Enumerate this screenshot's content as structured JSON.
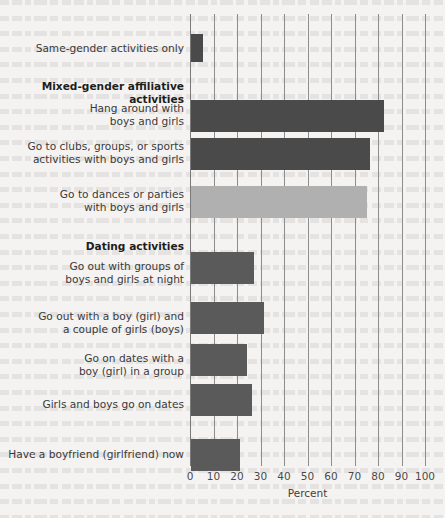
{
  "chart_data": {
    "type": "bar",
    "orientation": "horizontal",
    "title": "",
    "subtitle": "",
    "xlabel": "Percent",
    "ylabel": "",
    "xlim": [
      0,
      100
    ],
    "x_ticks": [
      0,
      10,
      20,
      30,
      40,
      50,
      60,
      70,
      80,
      90,
      100
    ],
    "x_tick_labels": [
      "0",
      "10",
      "20",
      "30",
      "40",
      "50",
      "60",
      "70",
      "80",
      "90",
      "100"
    ],
    "grid": "vertical",
    "legend": "none",
    "categories": [
      "Same-gender activities only",
      "Hang around with\nboys and girls",
      "Go to clubs, groups, or sports\nactivities with boys and girls",
      "Go to dances or parties\nwith boys and girls",
      "Go out with groups of\nboys and girls at night",
      "Go out with a boy (girl) and\na couple of girls (boys)",
      "Go on dates with a\nboy (girl) in a group",
      "Girls and boys go on dates",
      "Have a boyfriend (girlfriend) now"
    ],
    "values": [
      5,
      82,
      76,
      75,
      27,
      31,
      24,
      26,
      21
    ],
    "group_headers": [
      "Mixed-gender affiliative activities",
      "Dating activities"
    ],
    "bars": [
      {
        "label": "Same-gender activities only",
        "value": 5,
        "color": "#4a4a4a",
        "top": 20,
        "height": 28,
        "group": ""
      },
      {
        "label": "Hang around with\nboys and girls",
        "value": 82,
        "color": "#4a4a4a",
        "top": 86,
        "height": 32,
        "group": "Mixed-gender affiliative activities"
      },
      {
        "label": "Go to clubs, groups, or sports\nactivities with boys and girls",
        "value": 76,
        "color": "#4a4a4a",
        "top": 124,
        "height": 32,
        "group": "Mixed-gender affiliative activities"
      },
      {
        "label": "Go to dances or parties\nwith boys and girls",
        "value": 75,
        "color": "#b0b0b0",
        "top": 172,
        "height": 32,
        "group": "Mixed-gender affiliative activities"
      },
      {
        "label": "Go out with groups of\nboys and girls at night",
        "value": 27,
        "color": "#5a5a5a",
        "top": 238,
        "height": 32,
        "group": "Dating activities"
      },
      {
        "label": "Go out with a boy (girl) and\na couple of girls (boys)",
        "value": 31,
        "color": "#5a5a5a",
        "top": 288,
        "height": 32,
        "group": "Dating activities"
      },
      {
        "label": "Go on dates with a\nboy (girl) in a group",
        "value": 24,
        "color": "#5a5a5a",
        "top": 330,
        "height": 32,
        "group": "Dating activities"
      },
      {
        "label": "Girls and boys go on dates",
        "value": 26,
        "color": "#5a5a5a",
        "top": 370,
        "height": 32,
        "group": "Dating activities"
      },
      {
        "label": "Have a boyfriend (girlfriend) now",
        "value": 21,
        "color": "#5a5a5a",
        "top": 425,
        "height": 32,
        "group": "Dating activities"
      }
    ],
    "row_labels": [
      {
        "text": "Same-gender activities only",
        "top": 28,
        "bold": false
      },
      {
        "text": "Mixed-gender affiliative activities",
        "top": 66,
        "bold": true
      },
      {
        "text": "Hang around with\nboys and girls",
        "top": 88,
        "bold": false
      },
      {
        "text": "Go to clubs, groups, or sports\nactivities with boys and girls",
        "top": 126,
        "bold": false
      },
      {
        "text": "Go to dances or parties\nwith boys and girls",
        "top": 174,
        "bold": false
      },
      {
        "text": "Dating activities",
        "top": 226,
        "bold": true
      },
      {
        "text": "Go out with groups of\nboys and girls at night",
        "top": 246,
        "bold": false
      },
      {
        "text": "Go out with a boy (girl) and\na couple of girls (boys)",
        "top": 296,
        "bold": false
      },
      {
        "text": "Go on dates with a\nboy (girl) in a group",
        "top": 338,
        "bold": false
      },
      {
        "text": "Girls and boys go on dates",
        "top": 384,
        "bold": false
      },
      {
        "text": "Have a boyfriend (girlfriend) now",
        "top": 434,
        "bold": false
      }
    ],
    "colors": {
      "bar_dark": "#4a4a4a",
      "bar_medium": "#5a5a5a",
      "bar_light": "#b0b0b0",
      "gridline": "#8d8d8d",
      "axis": "#7a7a7a",
      "background": "#f4f3f1",
      "text": "#3a3a3a"
    }
  }
}
